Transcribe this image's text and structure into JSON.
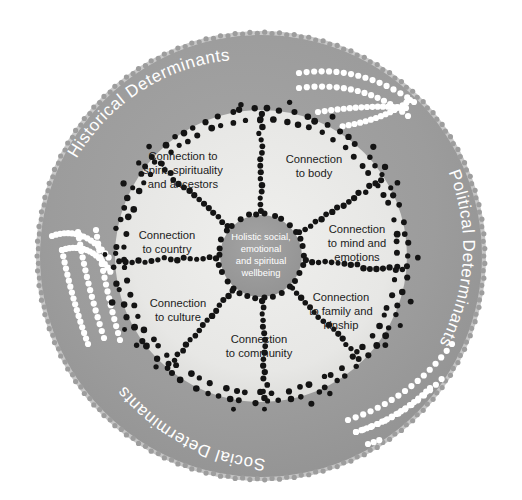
{
  "diagram": {
    "type": "concentric-wheel",
    "colors": {
      "outer_ring_fill": "#9d9d9d",
      "inner_disc_fill": "#e8e8e6",
      "hub_fill": "#9b9b9b",
      "dot_dark": "#141414",
      "dot_white": "#ffffff",
      "label_text": "#1c1c1c",
      "ring_text": "#ffffff",
      "background": "#ffffff"
    },
    "hub": {
      "name": "hub-core",
      "lines": [
        "Holistic social,",
        "emotional",
        "and spiritual",
        "wellbeing"
      ],
      "text": "Holistic social, emotional and spiritual wellbeing"
    },
    "segments": [
      {
        "id": "spirit",
        "lines": [
          "Connection to",
          "spirit, spirituality",
          "and ancestors"
        ],
        "text": "Connection to spirit, spirituality and ancestors",
        "angle_deg": 306,
        "label_x": 183,
        "label_y": 170
      },
      {
        "id": "body",
        "lines": [
          "Connection",
          "to body"
        ],
        "text": "Connection to body",
        "angle_deg": 350,
        "label_x": 314,
        "label_y": 168
      },
      {
        "id": "mind",
        "lines": [
          "Connection",
          "to mind and",
          "emotions"
        ],
        "text": "Connection to mind and emotions",
        "angle_deg": 26,
        "label_x": 355,
        "label_y": 243
      },
      {
        "id": "family",
        "lines": [
          "Connection",
          "to family and",
          "kinship"
        ],
        "text": "Connection to family and kinship",
        "angle_deg": 66,
        "label_x": 340,
        "label_y": 311
      },
      {
        "id": "community",
        "lines": [
          "Connection",
          "to community"
        ],
        "text": "Connection to community",
        "angle_deg": 108,
        "label_x": 259,
        "label_y": 347
      },
      {
        "id": "culture",
        "lines": [
          "Connection",
          "to culture"
        ],
        "text": "Connection to culture",
        "angle_deg": 152,
        "label_x": 178,
        "label_y": 311
      },
      {
        "id": "country",
        "lines": [
          "Connection",
          "to country"
        ],
        "text": "Connection to country",
        "angle_deg": 200,
        "label_x": 167,
        "label_y": 243
      }
    ],
    "outer_ring_labels": [
      {
        "id": "historical",
        "text": "Historical Determinants",
        "position": "upper-left",
        "path_start_deg": 228,
        "path_end_deg": 292
      },
      {
        "id": "political",
        "text": "Political Determinants",
        "position": "right",
        "path_start_deg": -60,
        "path_end_deg": 52
      },
      {
        "id": "social",
        "text": "Social Determinants",
        "position": "bottom-left",
        "path_start_deg": 170,
        "path_end_deg": 110
      }
    ],
    "decorations": [
      {
        "id": "leaf-top-right",
        "style": "white-dotted-leaf",
        "color": "#ffffff"
      },
      {
        "id": "leaf-left",
        "style": "white-dotted-leaf",
        "color": "#ffffff"
      },
      {
        "id": "leaf-bottom-right",
        "style": "white-dotted-leaf",
        "color": "#ffffff"
      }
    ]
  }
}
